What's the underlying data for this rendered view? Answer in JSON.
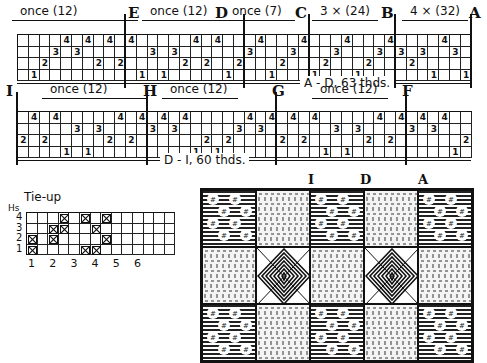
{
  "threading_top": {
    "segments": [
      {
        "label": "once (12)",
        "x": 20,
        "w": 110
      },
      {
        "label": "E",
        "type": "letter",
        "x": 128
      },
      {
        "label": "once (12)",
        "x": 150,
        "w": 70
      },
      {
        "label": "D",
        "type": "letter",
        "x": 215
      },
      {
        "label": "once (7)",
        "x": 232,
        "w": 55
      },
      {
        "label": "C",
        "type": "letter",
        "x": 295
      },
      {
        "label": "3 × (24)",
        "x": 320,
        "w": 50
      },
      {
        "label": "B",
        "type": "letter",
        "x": 381
      },
      {
        "label": "4 × (32)",
        "x": 410,
        "w": 50
      },
      {
        "label": "A",
        "type": "letter",
        "x": 469
      }
    ],
    "dividers": [
      {
        "letter": "E",
        "col": 10
      },
      {
        "letter": "D",
        "col": 21
      },
      {
        "letter": "C",
        "col": 27
      },
      {
        "letter": "B",
        "col": 35
      },
      {
        "letter": "A",
        "col": 42
      }
    ],
    "threads": [
      {
        "col": 1,
        "shaft": 1
      },
      {
        "col": 2,
        "shaft": 2
      },
      {
        "col": 3,
        "shaft": 3
      },
      {
        "col": 4,
        "shaft": 4
      },
      {
        "col": 5,
        "shaft": 3
      },
      {
        "col": 6,
        "shaft": 4
      },
      {
        "col": 7,
        "shaft": 2
      },
      {
        "col": 8,
        "shaft": 4
      },
      {
        "col": 9,
        "shaft": 2
      },
      {
        "col": 10,
        "shaft": 4
      },
      {
        "col": 11,
        "shaft": 1
      },
      {
        "col": 12,
        "shaft": 3
      },
      {
        "col": 13,
        "shaft": 1
      },
      {
        "col": 14,
        "shaft": 3
      },
      {
        "col": 15,
        "shaft": 2
      },
      {
        "col": 16,
        "shaft": 4
      },
      {
        "col": 17,
        "shaft": 2
      },
      {
        "col": 18,
        "shaft": 4
      },
      {
        "col": 19,
        "shaft": 1
      },
      {
        "col": 20,
        "shaft": 2
      },
      {
        "col": 21,
        "shaft": 3
      },
      {
        "col": 22,
        "shaft": 4
      },
      {
        "col": 23,
        "shaft": 1
      },
      {
        "col": 24,
        "shaft": 2
      },
      {
        "col": 25,
        "shaft": 3
      },
      {
        "col": 26,
        "shaft": 4
      },
      {
        "col": 27,
        "shaft": 1
      },
      {
        "col": 28,
        "shaft": 2
      },
      {
        "col": 29,
        "shaft": 3
      },
      {
        "col": 30,
        "shaft": 4
      },
      {
        "col": 31,
        "shaft": 1
      },
      {
        "col": 32,
        "shaft": 2
      },
      {
        "col": 33,
        "shaft": 3
      },
      {
        "col": 34,
        "shaft": 4
      },
      {
        "col": 35,
        "shaft": 3
      },
      {
        "col": 36,
        "shaft": 2
      },
      {
        "col": 37,
        "shaft": 3
      },
      {
        "col": 38,
        "shaft": 1
      },
      {
        "col": 39,
        "shaft": 4
      },
      {
        "col": 40,
        "shaft": 3
      },
      {
        "col": 41,
        "shaft": 1
      }
    ],
    "total_label": "A - D, 63 thds."
  },
  "threading_bottom": {
    "segments": [
      {
        "label": "I",
        "type": "letter",
        "x": 6
      },
      {
        "label": "once (12)",
        "x": 50,
        "w": 90
      },
      {
        "label": "H",
        "type": "letter",
        "x": 143
      },
      {
        "label": "once (12)",
        "x": 170,
        "w": 60
      },
      {
        "label": "G",
        "type": "letter",
        "x": 272
      },
      {
        "label": "once (12)",
        "x": 320,
        "w": 60
      },
      {
        "label": "F",
        "type": "letter",
        "x": 402
      }
    ],
    "dividers": [
      {
        "letter": "I",
        "col": 0
      },
      {
        "letter": "H",
        "col": 12
      },
      {
        "letter": "G",
        "col": 24
      },
      {
        "letter": "F",
        "col": 36
      }
    ],
    "threads": [
      {
        "col": 0,
        "shaft": 2
      },
      {
        "col": 1,
        "shaft": 4
      },
      {
        "col": 2,
        "shaft": 2
      },
      {
        "col": 3,
        "shaft": 4
      },
      {
        "col": 4,
        "shaft": 1
      },
      {
        "col": 5,
        "shaft": 3
      },
      {
        "col": 6,
        "shaft": 1
      },
      {
        "col": 7,
        "shaft": 3
      },
      {
        "col": 8,
        "shaft": 2
      },
      {
        "col": 9,
        "shaft": 4
      },
      {
        "col": 10,
        "shaft": 2
      },
      {
        "col": 11,
        "shaft": 4
      },
      {
        "col": 12,
        "shaft": 3
      },
      {
        "col": 13,
        "shaft": 4
      },
      {
        "col": 14,
        "shaft": 3
      },
      {
        "col": 15,
        "shaft": 4
      },
      {
        "col": 16,
        "shaft": 1
      },
      {
        "col": 17,
        "shaft": 2
      },
      {
        "col": 18,
        "shaft": 1
      },
      {
        "col": 19,
        "shaft": 2
      },
      {
        "col": 20,
        "shaft": 3
      },
      {
        "col": 21,
        "shaft": 4
      },
      {
        "col": 22,
        "shaft": 3
      },
      {
        "col": 23,
        "shaft": 4
      },
      {
        "col": 24,
        "shaft": 2
      },
      {
        "col": 25,
        "shaft": 4
      },
      {
        "col": 26,
        "shaft": 2
      },
      {
        "col": 27,
        "shaft": 4
      },
      {
        "col": 28,
        "shaft": 1
      },
      {
        "col": 29,
        "shaft": 3
      },
      {
        "col": 30,
        "shaft": 1
      },
      {
        "col": 31,
        "shaft": 3
      },
      {
        "col": 32,
        "shaft": 2
      },
      {
        "col": 33,
        "shaft": 4
      },
      {
        "col": 34,
        "shaft": 2
      },
      {
        "col": 35,
        "shaft": 4
      },
      {
        "col": 36,
        "shaft": 3
      },
      {
        "col": 37,
        "shaft": 4
      },
      {
        "col": 38,
        "shaft": 3
      },
      {
        "col": 39,
        "shaft": 4
      },
      {
        "col": 40,
        "shaft": 1
      },
      {
        "col": 41,
        "shaft": 2
      }
    ],
    "total_label": "D - I, 60 thds."
  },
  "tieup": {
    "title": "Tie-up",
    "axis_label": "Hs",
    "row_labels": [
      "4",
      "3",
      "2",
      "1"
    ],
    "col_labels": [
      "1",
      "2",
      "3",
      "4",
      "5",
      "6"
    ],
    "marks": [
      {
        "row": 4,
        "col": 3
      },
      {
        "row": 4,
        "col": 5
      },
      {
        "row": 4,
        "col": 7
      },
      {
        "row": 3,
        "col": 2
      },
      {
        "row": 3,
        "col": 3
      },
      {
        "row": 3,
        "col": 6
      },
      {
        "row": 2,
        "col": 0
      },
      {
        "row": 2,
        "col": 2
      },
      {
        "row": 2,
        "col": 7
      },
      {
        "row": 1,
        "col": 0
      },
      {
        "row": 1,
        "col": 5
      },
      {
        "row": 1,
        "col": 6
      }
    ]
  },
  "drawdown": {
    "letters": [
      {
        "label": "I",
        "x": 308
      },
      {
        "label": "D",
        "x": 360
      },
      {
        "label": "A",
        "x": 418
      }
    ],
    "blocks": [
      [
        "dots",
        "plain",
        "dots",
        "plain",
        "dots"
      ],
      [
        "plain",
        "diamond",
        "plain",
        "diamond",
        "plain"
      ],
      [
        "dots",
        "plain",
        "dots",
        "plain",
        "dots"
      ]
    ]
  }
}
